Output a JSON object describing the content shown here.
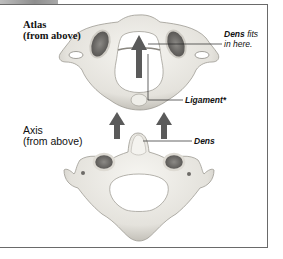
{
  "figure": {
    "atlas": {
      "title": "Atlas",
      "subtitle": "(from above)"
    },
    "axis": {
      "title": "Axis",
      "subtitle": "(from above)"
    },
    "callouts": {
      "dens_fits_bold": "Dens",
      "dens_fits_rest": " fits",
      "dens_fits_line2": "in here.",
      "ligament": "Ligament*",
      "dens": "Dens"
    },
    "colors": {
      "bone": "#e9e7e1",
      "bone_shadow": "#b9b6ae",
      "arrow": "#5a5a5a",
      "border": "#6a6a6a"
    }
  }
}
